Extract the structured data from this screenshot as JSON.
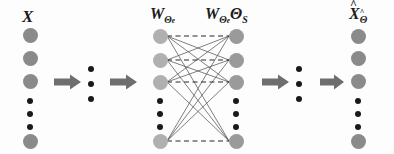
{
  "figure": {
    "background_color": "#fdfdfd"
  },
  "colors": {
    "node_outer": "#8a8a8a",
    "node_middle_left": "#b0b0b0",
    "node_middle_right": "#9a9a9a",
    "dot": "#1a1a1a",
    "arrow": "#6e6e6e",
    "wire_solid": "#555555",
    "wire_dashed": "#2b2b2b",
    "text": "#1a1a1a"
  },
  "labels": {
    "input": {
      "base": "X",
      "sub": "",
      "subsub": "",
      "hat": false
    },
    "hidden_left": {
      "base": "W",
      "sub": "Θ",
      "subsub": "e",
      "hat": false
    },
    "hidden_right": {
      "base": "W",
      "sub": "Θ",
      "subsub": "e",
      "second_base": "Θ",
      "second_sub": "S",
      "hat": false
    },
    "output": {
      "base": "X",
      "sub": "Θ",
      "subsub": "",
      "hat": true
    }
  },
  "layers": [
    {
      "id": "input-layer",
      "name": "input-layer",
      "label_key": "input",
      "x": 30,
      "nodes": [
        {
          "type": "big",
          "y": 35
        },
        {
          "type": "big",
          "y": 58
        },
        {
          "type": "big",
          "y": 81
        },
        {
          "type": "dot",
          "y": 101
        },
        {
          "type": "dot",
          "y": 114
        },
        {
          "type": "dot",
          "y": 127
        },
        {
          "type": "big",
          "y": 141
        }
      ]
    },
    {
      "id": "hidden-left-layer",
      "name": "hidden-left-layer",
      "label_key": "hidden_left",
      "x": 160,
      "nodes": [
        {
          "type": "big",
          "y": 36
        },
        {
          "type": "big",
          "y": 60
        },
        {
          "type": "big",
          "y": 82
        },
        {
          "type": "dot",
          "y": 101
        },
        {
          "type": "dot",
          "y": 114
        },
        {
          "type": "dot",
          "y": 127
        },
        {
          "type": "big",
          "y": 141
        }
      ]
    },
    {
      "id": "hidden-right-layer",
      "name": "hidden-right-layer",
      "label_key": "hidden_right",
      "x": 236,
      "nodes": [
        {
          "type": "big",
          "y": 36
        },
        {
          "type": "big",
          "y": 60
        },
        {
          "type": "big",
          "y": 82
        },
        {
          "type": "dot",
          "y": 101
        },
        {
          "type": "dot",
          "y": 114
        },
        {
          "type": "dot",
          "y": 127
        },
        {
          "type": "big",
          "y": 141
        }
      ]
    },
    {
      "id": "output-layer",
      "name": "output-layer",
      "label_key": "output",
      "x": 358,
      "nodes": [
        {
          "type": "big",
          "y": 36
        },
        {
          "type": "big",
          "y": 58
        },
        {
          "type": "big",
          "y": 81
        },
        {
          "type": "dot",
          "y": 101
        },
        {
          "type": "dot",
          "y": 114
        },
        {
          "type": "dot",
          "y": 127
        },
        {
          "type": "big",
          "y": 141
        }
      ]
    }
  ],
  "arrows": [
    {
      "id": "arrow-1",
      "name": "encoder-arrow-1",
      "x": 56,
      "y": 81
    },
    {
      "id": "arrow-2",
      "name": "encoder-arrow-2",
      "x": 113,
      "y": 81
    },
    {
      "id": "arrow-3",
      "name": "decoder-arrow-1",
      "x": 264,
      "y": 81
    },
    {
      "id": "arrow-4",
      "name": "decoder-arrow-2",
      "x": 322,
      "y": 81
    }
  ],
  "ellipses": [
    {
      "id": "ellipsis-encoder",
      "name": "encoder-ellipsis",
      "x": 90,
      "y": 68
    },
    {
      "id": "ellipsis-decoder",
      "name": "decoder-ellipsis",
      "x": 298,
      "y": 68
    }
  ],
  "connections": {
    "dashed_pairs": [
      [
        0,
        0
      ],
      [
        1,
        1
      ],
      [
        2,
        2
      ],
      [
        6,
        6
      ]
    ],
    "solid_note": "fully-connected cross links between hidden-left and hidden-right big nodes"
  }
}
